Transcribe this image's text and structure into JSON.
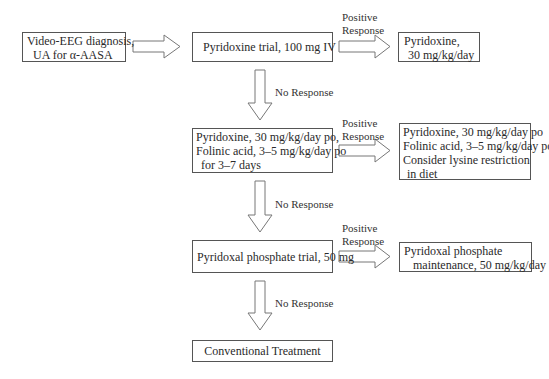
{
  "nodes": {
    "diagnosis": {
      "lines": [
        "Video-EEG diagnosis,",
        "UA for α-AASA"
      ]
    },
    "pyridoxine_trial": {
      "lines": [
        "Pyridoxine trial, 100 mg IV"
      ]
    },
    "pyridoxine_maint": {
      "lines": [
        "Pyridoxine,",
        "30 mg/kg/day"
      ]
    },
    "combo_trial": {
      "lines": [
        "Pyridoxine, 30 mg/kg/day po,",
        "Folinic acid, 3–5 mg/kg/day po",
        "for 3–7 days"
      ]
    },
    "combo_maint": {
      "lines": [
        "Pyridoxine, 30 mg/kg/day po",
        "Folinic acid, 3–5 mg/kg/day po",
        "Consider lysine restriction",
        "in diet"
      ]
    },
    "plp_trial": {
      "lines": [
        "Pyridoxal phosphate trial, 50 mg"
      ]
    },
    "plp_maint": {
      "lines": [
        "Pyridoxal phosphate",
        "maintenance, 50 mg/kg/day"
      ]
    },
    "conventional": {
      "lines": [
        "Conventional Treatment"
      ]
    }
  },
  "edge_labels": {
    "positive": [
      "Positive",
      "Response"
    ],
    "negative": "No Response"
  }
}
